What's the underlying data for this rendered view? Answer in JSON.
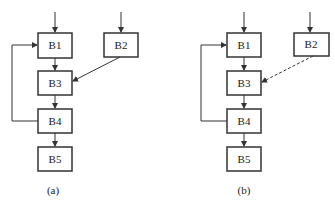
{
  "diagrams": [
    {
      "id": "a",
      "caption": "(a)",
      "blocks": [
        "B1",
        "B2",
        "B3",
        "B4",
        "B5"
      ],
      "edges": [
        {
          "from": "entry",
          "to": "B1",
          "style": "solid"
        },
        {
          "from": "entry",
          "to": "B2",
          "style": "solid"
        },
        {
          "from": "B1",
          "to": "B3",
          "style": "solid"
        },
        {
          "from": "B2",
          "to": "B3",
          "style": "solid"
        },
        {
          "from": "B3",
          "to": "B4",
          "style": "solid"
        },
        {
          "from": "B4",
          "to": "B1",
          "style": "solid"
        },
        {
          "from": "B4",
          "to": "B5",
          "style": "solid"
        }
      ]
    },
    {
      "id": "b",
      "caption": "(b)",
      "blocks": [
        "B1",
        "B2",
        "B3",
        "B4",
        "B5"
      ],
      "edges": [
        {
          "from": "entry",
          "to": "B1",
          "style": "solid"
        },
        {
          "from": "entry",
          "to": "B2",
          "style": "solid"
        },
        {
          "from": "B1",
          "to": "B3",
          "style": "solid"
        },
        {
          "from": "B2",
          "to": "B3",
          "style": "dashed"
        },
        {
          "from": "B3",
          "to": "B4",
          "style": "solid"
        },
        {
          "from": "B4",
          "to": "B1",
          "style": "solid"
        },
        {
          "from": "B4",
          "to": "B5",
          "style": "solid"
        }
      ]
    }
  ]
}
